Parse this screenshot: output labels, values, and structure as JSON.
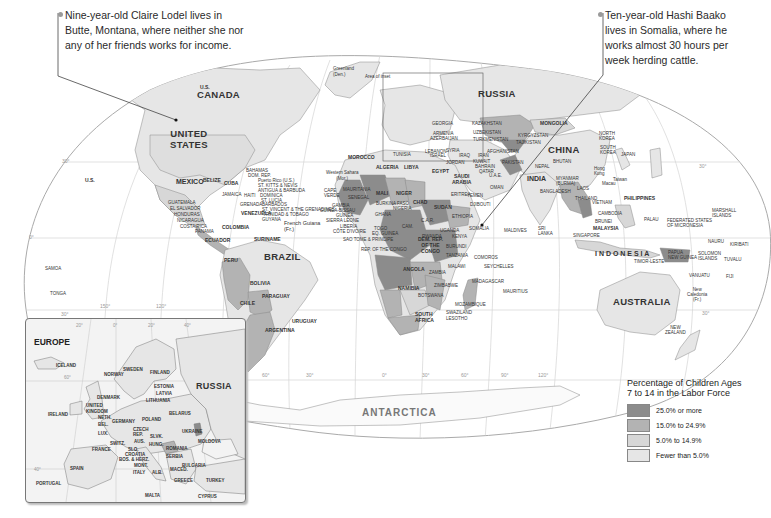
{
  "callouts": {
    "left": {
      "lines": [
        "Nine-year-old Claire Lodel lives in",
        "Butte, Montana, where neither she nor",
        "any of her friends works for income."
      ]
    },
    "right": {
      "lines": [
        "Ten-year-old Hashi Baako",
        "lives in Somalia, where he",
        "works almost 30 hours per",
        "week herding cattle."
      ]
    }
  },
  "legend": {
    "title_line1": "Percentage of Children Ages",
    "title_line2": "7 to 14 in the Labor Force",
    "items": [
      {
        "label": "25.0% or more",
        "color": "#8c8c8c"
      },
      {
        "label": "15.0% to 24.9%",
        "color": "#b3b3b3"
      },
      {
        "label": "5.0% to 14.9%",
        "color": "#d7d7d7"
      },
      {
        "label": "Fewer than 5.0%",
        "color": "#e6e6e6"
      }
    ]
  },
  "colors": {
    "tier1": "#8c8c8c",
    "tier2": "#b3b3b3",
    "tier3": "#d7d7d7",
    "tier4": "#e6e6e6",
    "ocean": "#ffffff",
    "graticule": "#cfcfcf",
    "border": "#777777"
  },
  "map": {
    "inset_area_label": "Area of inset",
    "antarctica": "ANTARCTICA",
    "degree_labels": [
      "30°",
      "0°",
      "30°",
      "150°",
      "120°",
      "90°",
      "60°",
      "30°",
      "0°",
      "30°",
      "60°",
      "90°",
      "120°",
      "150°",
      "30°",
      "30°"
    ],
    "large_labels": {
      "canada": "CANADA",
      "united_states": "UNITED\nSTATES",
      "mexico": "MEXICO",
      "brazil": "BRAZIL",
      "russia": "RUSSIA",
      "china": "CHINA",
      "india": "INDIA",
      "australia": "AUSTRALIA",
      "indonesia": "I N D O N E S I A"
    },
    "country_labels": {
      "us_alaska": "U.S.",
      "greenland": "Greenland\n(Den.)",
      "us_hawaii": "U.S.",
      "belize": "BELIZE",
      "cuba": "CUBA",
      "bahamas": "BAHAMAS",
      "dom_rep": "DOM. REP.",
      "puerto_rico": "Puerto Rico (U.S.)",
      "st_kitts": "ST. KITTS & NEVIS",
      "antigua": "ANTIGUA & BARBUDA",
      "dominica": "DOMINICA",
      "st_lucia": "ST. LUCIA",
      "barbados": "BARBADOS",
      "st_vincent": "ST. VINCENT & THE GRENADINES",
      "trinidad": "TRINIDAD & TOBAGO",
      "guyana": "GUYANA",
      "french_guiana": "French Guiana\n(Fr.)",
      "jamaica": "JAMAICA",
      "haiti": "HAITI",
      "grenada": "GRENADA",
      "guatemala": "GUATEMALA",
      "el_salvador": "EL SALVADOR",
      "honduras": "HONDURAS",
      "nicaragua": "NICARAGUA",
      "costa_rica": "COSTA RICA",
      "panama": "PANAMA",
      "venezuela": "VENEZUELA",
      "colombia": "COLOMBIA",
      "suriname": "SURINAME",
      "ecuador": "ECUADOR",
      "peru": "PERU",
      "bolivia": "BOLIVIA",
      "paraguay": "PARAGUAY",
      "chile": "CHILE",
      "argentina": "ARGENTINA",
      "uruguay": "URUGUAY",
      "samoa": "SAMOA",
      "tonga": "TONGA",
      "morocco": "MOROCCO",
      "algeria": "ALGERIA",
      "libya": "LIBYA",
      "egypt": "EGYPT",
      "western_sahara": "Western Sahara\n(Mor.)",
      "mauritania": "MAURITANIA",
      "mali": "MALI",
      "niger": "NIGER",
      "chad": "CHAD",
      "sudan": "SUDAN",
      "cape_verde": "CAPE\nVERDE",
      "senegal": "SENEGAL",
      "gambia": "GAMBIA",
      "guinea_bissau": "GUINEA-BISSAU",
      "guinea": "GUINEA",
      "sierra_leone": "SIERRA LEONE",
      "liberia": "LIBERIA",
      "cote_divoire": "CÔTE D'IVOIRE",
      "togo": "TOGO",
      "eq_guinea": "EQ. GUINEA",
      "sao_tome": "SAO TOME & PRINCIPE",
      "rep_congo": "REP. OF THE CONGO",
      "burkina": "BURKINA FASO",
      "ghana": "GHANA",
      "nigeria": "NIGERIA",
      "cameroon": "CAM.",
      "car": "C.A.R.",
      "ethiopia": "ETHIOPIA",
      "eritrea": "ERITREA",
      "djibouti": "DJIBOUTI",
      "somalia": "SOMALIA",
      "uganda": "UGANDA",
      "kenya": "KENYA",
      "rwanda": "RWANDA",
      "burundi": "BURUNDI",
      "tanzania": "TANZANIA",
      "dem_rep_congo": "DEM. REP.\nOF THE\nCONGO",
      "angola": "ANGOLA",
      "zambia": "ZAMBIA",
      "malawi": "MALAWI",
      "namibia": "NAMIBIA",
      "botswana": "BOTSWANA",
      "zimbabwe": "ZIMBABWE",
      "mozambique": "MOZAMBIQUE",
      "south_africa": "SOUTH\nAFRICA",
      "swaziland": "SWAZILAND",
      "lesotho": "LESOTHO",
      "madagascar": "MADAGASCAR",
      "comoros": "COMOROS",
      "seychelles": "SEYCHELLES",
      "mauritius": "MAURITIUS",
      "maldives": "MALDIVES",
      "sri_lanka": "SRI\nLANKA",
      "tunisia": "TUNISIA",
      "lebanon": "LEBANON",
      "israel": "ISRAEL",
      "jordan": "JORDAN",
      "syria": "SYRIA",
      "iraq": "IRAQ",
      "iran": "IRAN",
      "kuwait": "KUWAIT",
      "bahrain": "BAHRAIN",
      "qatar": "QATAR",
      "uae": "U.A.E.",
      "saudi_arabia": "SAUDI\nARABIA",
      "oman": "OMAN",
      "yemen": "YEMEN",
      "georgia": "GEORGIA",
      "armenia": "ARMENIA",
      "azerbaijan": "AZERBAIJAN",
      "kazakhstan": "KAZAKHSTAN",
      "uzbekistan": "UZBEKISTAN",
      "turkmenistan": "TURKMENISTAN",
      "kyrgyzstan": "KYRGYZSTAN",
      "tajikistan": "TAJIKISTAN",
      "afghanistan": "AFGHANISTAN",
      "pakistan": "PAKISTAN",
      "mongolia": "MONGOLIA",
      "nepal": "NEPAL",
      "bhutan": "BHUTAN",
      "bangladesh": "BANGLADESH",
      "myanmar": "MYANMAR\n(BURMA)",
      "laos": "LAOS",
      "thailand": "THAILAND",
      "vietnam": "VIETNAM",
      "cambodia": "CAMBODIA",
      "north_korea": "NORTH\nKOREA",
      "south_korea": "SOUTH\nKOREA",
      "japan": "JAPAN",
      "taiwan": "Taiwan",
      "hong_kong": "Hong\nKong",
      "macau": "Macau",
      "philippines": "PHILIPPINES",
      "brunei": "BRUNEI",
      "malaysia": "MALAYSIA",
      "singapore": "SINGAPORE",
      "palau": "PALAU",
      "micronesia": "FEDERATED STATES\nOF MICRONESIA",
      "marshall": "MARSHALL\nISLANDS",
      "nauru": "NAURU",
      "kiribati": "KIRIBATI",
      "png": "PAPUA\nNEW GUINEA",
      "solomon": "SOLOMON\nISLANDS",
      "tuvalu": "TUVALU",
      "east_timor": "TIMOR-LESTE",
      "vanuatu": "VANUATU",
      "fiji": "FIJI",
      "new_caledonia": "New\nCaledonia\n(Fr.)",
      "new_zealand": "NEW\nZEALAND"
    }
  },
  "inset": {
    "title": "EUROPE",
    "russia": "RUSSIA",
    "degree_labels": [
      "20°",
      "0°",
      "20°",
      "40°",
      "60°",
      "40°"
    ],
    "labels": {
      "iceland": "ICELAND",
      "norway": "NORWAY",
      "sweden": "SWEDEN",
      "finland": "FINLAND",
      "estonia": "ESTONIA",
      "latvia": "LATVIA",
      "lithuania": "LITHUANIA",
      "denmark": "DENMARK",
      "uk": "UNITED\nKINGDOM",
      "ireland": "IRELAND",
      "neth": "NETH.",
      "bel": "BEL.",
      "lux": "LUX.",
      "germany": "GERMANY",
      "poland": "POLAND",
      "belarus": "BELARUS",
      "czech": "CZECH\nREP.",
      "slvk": "SLVK.",
      "aus": "AUS.",
      "hung": "HUNG.",
      "ukraine": "UKRAINE",
      "moldova": "MOLDOVA",
      "romania": "ROMANIA",
      "switz": "SWITZ.",
      "france": "FRANCE",
      "slo": "SLO.",
      "croatia": "CROATIA",
      "bos": "BOS. & HERZ.",
      "serbia": "SERBIA",
      "mont": "MONT.",
      "bulgaria": "BULGARIA",
      "maced": "MACED.",
      "alb": "ALB.",
      "greece": "GREECE",
      "italy": "ITALY",
      "spain": "SPAIN",
      "portugal": "PORTUGAL",
      "turkey": "TURKEY",
      "malta": "MALTA",
      "cyprus": "CYPRUS"
    }
  }
}
